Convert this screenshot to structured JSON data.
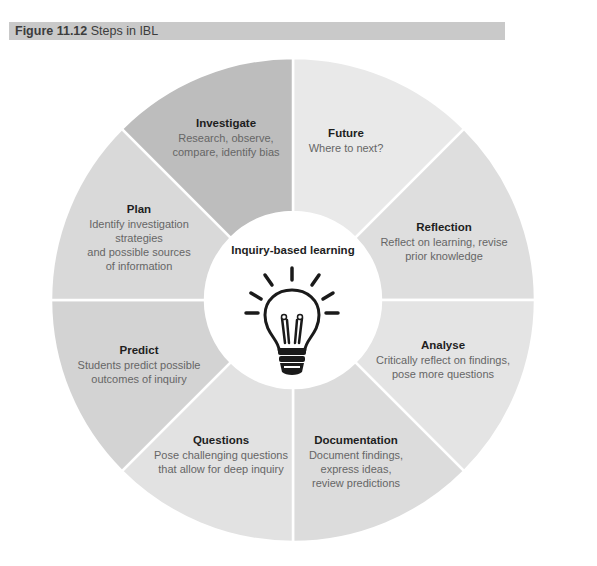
{
  "figure": {
    "number": "Figure 11.12",
    "title": "Steps in IBL"
  },
  "colors": {
    "header_bg": "#c9c9c9",
    "darkest_segment": "#bcbcbc",
    "medium_segment": "#d2d2d2",
    "light_segment": "#dedede",
    "lightest_segment": "#e9e9e9",
    "center_bg": "#ffffff"
  },
  "center": {
    "title": "Inquiry-based learning",
    "icon": "lightbulb-icon"
  },
  "segments": [
    {
      "title": "Future",
      "description": "Where to next?"
    },
    {
      "title": "Reflection",
      "description": "Reflect on learning, revise\nprior knowledge"
    },
    {
      "title": "Analyse",
      "description": "Critically reflect on findings,\npose more questions"
    },
    {
      "title": "Documentation",
      "description": "Document findings,\nexpress ideas,\nreview predictions"
    },
    {
      "title": "Questions",
      "description": "Pose challenging questions\nthat allow for deep inquiry"
    },
    {
      "title": "Predict",
      "description": "Students predict possible\noutcomes of inquiry"
    },
    {
      "title": "Plan",
      "description": "Identify investigation\nstrategies\nand possible sources\nof information"
    },
    {
      "title": "Investigate",
      "description": "Research, observe,\ncompare, identify bias"
    }
  ]
}
